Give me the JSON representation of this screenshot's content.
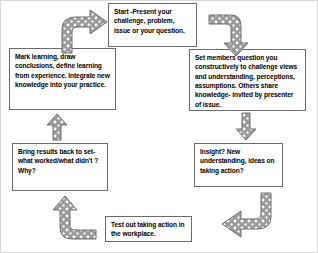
{
  "diagram": {
    "type": "cycle-flow-diagram",
    "colors": {
      "box_border": "#6b6b6b",
      "box_fill": "#ffffff",
      "text": "#000000",
      "arrow_fill": "#9a9a9a",
      "arrow_speckle": "#ffffff",
      "arrow_outline": "#6e6e6e",
      "canvas_border": "#d9d9d9"
    },
    "nodes": [
      {
        "id": "start",
        "name": "start-box",
        "text": "Start -Present your challenge, problem, issue or your question."
      },
      {
        "id": "set-members",
        "name": "set-members-box",
        "text": "Set members question you constructively to challenge views and understanding, perceptions, assumptions. Others share knowledge- invited by presenter of issue."
      },
      {
        "id": "insight",
        "name": "insight-box",
        "text": "Insight? New understanding, ideas on taking action?"
      },
      {
        "id": "test-out",
        "name": "test-out-box",
        "text": "Test out taking action in the workplace."
      },
      {
        "id": "bring-results",
        "name": "bring-results-box",
        "text": "Bring results back to set- what worked/what didn't ? Why?"
      },
      {
        "id": "mark-learning",
        "name": "mark-learning-box",
        "text": "Mark learning, draw conclusions, define learning from experience. Integrate new knowledge into your practice."
      }
    ],
    "arrows": [
      {
        "id": "a1",
        "name": "arrow-mark-learning-to-start",
        "shape": "curved-up-right"
      },
      {
        "id": "a2",
        "name": "arrow-start-to-set-members",
        "shape": "bent-right-down"
      },
      {
        "id": "a3",
        "name": "arrow-set-members-to-insight",
        "shape": "straight-down"
      },
      {
        "id": "a4",
        "name": "arrow-insight-to-test-out",
        "shape": "bent-down-left"
      },
      {
        "id": "a5",
        "name": "arrow-test-out-to-bring-results",
        "shape": "bent-left-up"
      },
      {
        "id": "a6",
        "name": "arrow-bring-results-to-mark-learning",
        "shape": "straight-up"
      }
    ]
  }
}
